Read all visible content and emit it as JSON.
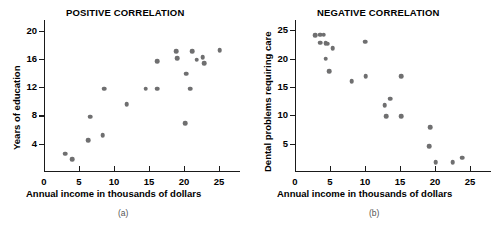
{
  "figure": {
    "panels": [
      {
        "id": "a",
        "caption": "(a)",
        "title": "POSITIVE CORRELATION",
        "xlabel": "Annual income in thousands of dollars",
        "ylabel": "Years of education"
      },
      {
        "id": "b",
        "caption": "(b)",
        "title": "NEGATIVE CORRELATION",
        "xlabel": "Annual income in thousands of dollars",
        "ylabel": "Dental problems requiring care"
      }
    ],
    "marker_color": "#6f6f70",
    "axis_color": "#1a1a1a"
  },
  "chart_data": [
    {
      "type": "scatter",
      "panel": "(a)",
      "title": "POSITIVE CORRELATION",
      "xlabel": "Annual income in thousands of dollars",
      "ylabel": "Years of education",
      "xlim": [
        0,
        28
      ],
      "ylim": [
        0,
        21.5
      ],
      "xticks": [
        0,
        5,
        10,
        15,
        20,
        25
      ],
      "yticks": [
        4,
        8,
        12,
        16,
        20
      ],
      "grid": false,
      "legend": false,
      "marker_color": "#6f6f70",
      "points": [
        {
          "x": 3.0,
          "y": 2.6
        },
        {
          "x": 4.0,
          "y": 1.8
        },
        {
          "x": 6.3,
          "y": 4.5
        },
        {
          "x": 6.6,
          "y": 7.8
        },
        {
          "x": 8.4,
          "y": 5.2
        },
        {
          "x": 8.6,
          "y": 11.8
        },
        {
          "x": 11.8,
          "y": 9.6
        },
        {
          "x": 14.5,
          "y": 11.8
        },
        {
          "x": 16.2,
          "y": 11.8
        },
        {
          "x": 16.2,
          "y": 15.7
        },
        {
          "x": 18.9,
          "y": 17.1
        },
        {
          "x": 19.0,
          "y": 16.1
        },
        {
          "x": 20.2,
          "y": 6.9
        },
        {
          "x": 20.3,
          "y": 13.9
        },
        {
          "x": 20.9,
          "y": 11.8
        },
        {
          "x": 21.2,
          "y": 17.1
        },
        {
          "x": 21.8,
          "y": 15.9
        },
        {
          "x": 22.7,
          "y": 16.2
        },
        {
          "x": 22.9,
          "y": 15.4
        },
        {
          "x": 25.1,
          "y": 17.2
        }
      ]
    },
    {
      "type": "scatter",
      "panel": "(b)",
      "title": "NEGATIVE CORRELATION",
      "xlabel": "Annual income in thousands of dollars",
      "ylabel": "Dental problems requiring care",
      "xlim": [
        0,
        28
      ],
      "ylim": [
        0,
        26.8
      ],
      "xticks": [
        0,
        5,
        10,
        15,
        20,
        25
      ],
      "yticks": [
        5,
        10,
        15,
        20,
        25
      ],
      "grid": false,
      "legend": false,
      "marker_color": "#6f6f70",
      "points": [
        {
          "x": 2.9,
          "y": 24.1
        },
        {
          "x": 3.6,
          "y": 24.2
        },
        {
          "x": 4.1,
          "y": 24.2
        },
        {
          "x": 3.6,
          "y": 22.8
        },
        {
          "x": 4.4,
          "y": 22.7
        },
        {
          "x": 4.7,
          "y": 22.6
        },
        {
          "x": 5.4,
          "y": 21.8
        },
        {
          "x": 4.4,
          "y": 20.0
        },
        {
          "x": 4.9,
          "y": 17.8
        },
        {
          "x": 8.1,
          "y": 16.0
        },
        {
          "x": 10.0,
          "y": 23.0
        },
        {
          "x": 10.1,
          "y": 16.9
        },
        {
          "x": 12.8,
          "y": 11.8
        },
        {
          "x": 13.0,
          "y": 9.8
        },
        {
          "x": 13.6,
          "y": 12.9
        },
        {
          "x": 15.2,
          "y": 9.8
        },
        {
          "x": 15.2,
          "y": 16.9
        },
        {
          "x": 19.3,
          "y": 7.9
        },
        {
          "x": 19.2,
          "y": 4.6
        },
        {
          "x": 20.1,
          "y": 1.7
        },
        {
          "x": 22.5,
          "y": 1.7
        },
        {
          "x": 23.9,
          "y": 2.5
        }
      ]
    }
  ]
}
